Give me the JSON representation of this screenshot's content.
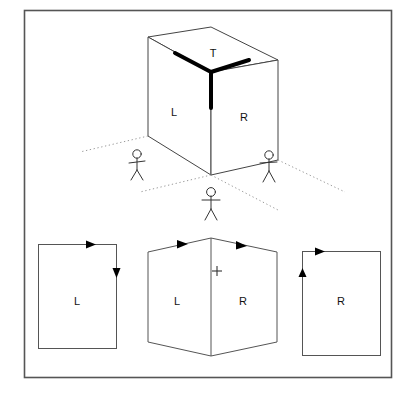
{
  "figure": {
    "border": {
      "x": 24,
      "y": 10,
      "width": 368,
      "height": 368,
      "color": "#555555"
    }
  },
  "cube": {
    "face_labels": {
      "top": "T",
      "left": "L",
      "right": "R"
    },
    "label_positions": {
      "top": {
        "x": 213,
        "y": 57
      },
      "left": {
        "x": 174,
        "y": 116
      },
      "right": {
        "x": 244,
        "y": 121
      }
    },
    "geometry": {
      "top_back": {
        "x": 211,
        "y": 27
      },
      "top_left": {
        "x": 148,
        "y": 37
      },
      "top_front": {
        "x": 211,
        "y": 72
      },
      "top_right": {
        "x": 278,
        "y": 60
      },
      "bottom_left": {
        "x": 148,
        "y": 136
      },
      "bottom_front": {
        "x": 211,
        "y": 175
      },
      "bottom_right": {
        "x": 278,
        "y": 160
      }
    },
    "highlight": {
      "description": "thick black Y at near corner of top face",
      "color": "#000000",
      "stroke_width": 4
    },
    "line_color": "#444444",
    "line_width": 1
  },
  "observers": [
    {
      "name": "observer-left",
      "x": 137,
      "y": 155,
      "sees": "L"
    },
    {
      "name": "observer-right",
      "x": 267,
      "y": 155,
      "sees": "R"
    },
    {
      "name": "observer-front",
      "x": 211,
      "y": 198,
      "sees": "L and R"
    }
  ],
  "sight_lines": {
    "color": "#999999",
    "style": "dotted",
    "origin": {
      "x": 211,
      "y": 175
    }
  },
  "panels": [
    {
      "name": "panel-left",
      "label": "L",
      "label_x": 77,
      "label_y": 305,
      "rect": {
        "x": 38,
        "y": 244,
        "width": 78,
        "height": 104
      },
      "arrows": [
        {
          "name": "arrow-top-right",
          "direction": "right",
          "x": 92,
          "y": 244
        },
        {
          "name": "arrow-side-down",
          "direction": "down",
          "x": 116,
          "y": 272
        }
      ]
    },
    {
      "name": "panel-middle",
      "labels": [
        "L",
        "R"
      ],
      "left_label_x": 177,
      "left_label_y": 305,
      "right_label_x": 243,
      "right_label_y": 305,
      "plus_mark": {
        "x": 217,
        "y": 271,
        "symbol": "+"
      },
      "outline": [
        {
          "x": 148,
          "y": 252
        },
        {
          "x": 211,
          "y": 238
        },
        {
          "x": 277,
          "y": 252
        },
        {
          "x": 277,
          "y": 342
        },
        {
          "x": 211,
          "y": 356
        },
        {
          "x": 148,
          "y": 342
        }
      ],
      "center_seam": {
        "x1": 211,
        "y1": 238,
        "x2": 211,
        "y2": 356
      },
      "arrows": [
        {
          "name": "arrow-left-top",
          "direction": "right-up",
          "x": 182,
          "y": 244
        },
        {
          "name": "arrow-right-top",
          "direction": "right-down",
          "x": 242,
          "y": 245
        }
      ]
    },
    {
      "name": "panel-right",
      "label": "R",
      "label_x": 341,
      "label_y": 305,
      "rect": {
        "x": 302,
        "y": 251,
        "width": 78,
        "height": 104
      },
      "arrows": [
        {
          "name": "arrow-top-right",
          "direction": "right",
          "x": 322,
          "y": 251
        },
        {
          "name": "arrow-side-up",
          "direction": "up",
          "x": 302,
          "y": 276
        }
      ]
    }
  ],
  "colors": {
    "stroke": "#444444",
    "border": "#555555",
    "accent_black": "#000000",
    "dotted": "#9a9a9a",
    "background": "#ffffff"
  }
}
